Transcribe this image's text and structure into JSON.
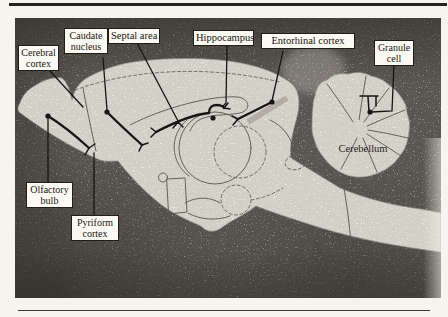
{
  "figure": {
    "type": "anatomical-diagram",
    "labels": [
      {
        "id": "cerebral-cortex",
        "boxed": true,
        "lines": [
          "Cerebral",
          "cortex"
        ]
      },
      {
        "id": "caudate-nucleus",
        "boxed": true,
        "lines": [
          "Caudate",
          "nucleus"
        ]
      },
      {
        "id": "septal-area",
        "boxed": true,
        "lines": [
          "Septal area"
        ]
      },
      {
        "id": "hippocampus",
        "boxed": true,
        "lines": [
          "Hippocampus"
        ]
      },
      {
        "id": "entorhinal-cortex",
        "boxed": true,
        "lines": [
          "Entorhinal cortex"
        ]
      },
      {
        "id": "granule-cell",
        "boxed": true,
        "lines": [
          "Granule",
          "cell"
        ]
      },
      {
        "id": "olfactory-bulb",
        "boxed": true,
        "lines": [
          "Olfactory",
          "bulb"
        ]
      },
      {
        "id": "pyriform-cortex",
        "boxed": true,
        "lines": [
          "Pyriform",
          "cortex"
        ]
      },
      {
        "id": "cerebellum",
        "boxed": false,
        "lines": [
          "Cerebellum"
        ]
      }
    ],
    "colors": {
      "paper": "#f6f4ee",
      "stipple_background": "#a9a59d",
      "brain_white": "#f5f2ea",
      "ink": "#181512",
      "outline_gray": "#5b564e",
      "label_background": "#fbf9f3",
      "label_border": "#221e17"
    }
  }
}
